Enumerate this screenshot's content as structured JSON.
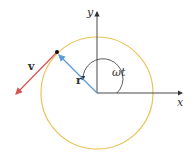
{
  "diagram": {
    "type": "circular-motion",
    "labels": {
      "y_axis": "y",
      "x_axis": "x",
      "angle": "ωt",
      "position_vector": "r",
      "velocity_vector": "v"
    },
    "colors": {
      "circle": "#e8c35a",
      "position_vector": "#5b9bd5",
      "velocity_vector": "#d9534f",
      "axes": "#333333",
      "point": "#111111"
    }
  }
}
